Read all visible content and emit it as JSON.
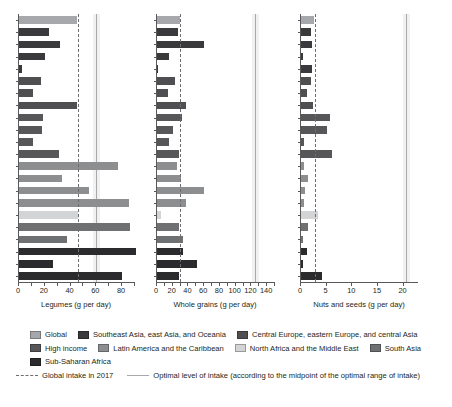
{
  "chart_data": {
    "type": "bar",
    "orientation": "horizontal",
    "title": "",
    "grid": false,
    "legend_position": "bottom",
    "series_names": [
      "Global",
      "Southeast Asia, east Asia, and Oceania",
      "Central Europe, eastern Europe, and central Asia",
      "High income",
      "Latin America and the Caribbean",
      "North Africa and the Middle East",
      "South Asia",
      "Sub-Saharan Africa"
    ],
    "series_colors": [
      "#a6a8ab",
      "#3a3a3c",
      "#4f4f52",
      "#575759",
      "#8c8e90",
      "#d3d4d5",
      "#6e7072",
      "#2b2b2d"
    ],
    "reference_lines": [
      {
        "name": "Global intake in 2017",
        "style": "dashed",
        "color": "#6d6e71"
      },
      {
        "name": "Optimal level of intake (according to the midpoint of the optimal range of intake)",
        "style": "solid",
        "color": "#a7a9ac"
      }
    ],
    "panels": [
      {
        "id": "legumes",
        "xlabel": "Legumes (g per day)",
        "xlim": [
          0,
          90
        ],
        "xticks": [
          0,
          10,
          20,
          30,
          40,
          50,
          60,
          70,
          80,
          90
        ],
        "xticklabels": [
          "0",
          "",
          "20",
          "",
          "40",
          "",
          "60",
          "",
          "80",
          ""
        ],
        "global_intake": 46,
        "optimal_level": 60,
        "bars": [
          {
            "group": "Global",
            "value": 45,
            "color": "#a6a8ab"
          },
          {
            "group": "Southeast Asia, east Asia, and Oceania",
            "value": 23,
            "color": "#3a3a3c"
          },
          {
            "group": "Southeast Asia, east Asia, and Oceania",
            "value": 32,
            "color": "#3a3a3c"
          },
          {
            "group": "Southeast Asia, east Asia, and Oceania",
            "value": 20,
            "color": "#3a3a3c"
          },
          {
            "group": "Southeast Asia, east Asia, and Oceania",
            "value": 2,
            "color": "#3a3a3c"
          },
          {
            "group": "Central Europe, eastern Europe, and central Asia",
            "value": 17,
            "color": "#4f4f52"
          },
          {
            "group": "Central Europe, eastern Europe, and central Asia",
            "value": 11,
            "color": "#4f4f52"
          },
          {
            "group": "Central Europe, eastern Europe, and central Asia",
            "value": 45,
            "color": "#4f4f52"
          },
          {
            "group": "High income",
            "value": 19,
            "color": "#575759"
          },
          {
            "group": "High income",
            "value": 18,
            "color": "#575759"
          },
          {
            "group": "High income",
            "value": 11,
            "color": "#575759"
          },
          {
            "group": "High income",
            "value": 31,
            "color": "#575759"
          },
          {
            "group": "Latin America and the Caribbean",
            "value": 77,
            "color": "#8c8e90"
          },
          {
            "group": "Latin America and the Caribbean",
            "value": 33,
            "color": "#8c8e90"
          },
          {
            "group": "Latin America and the Caribbean",
            "value": 54,
            "color": "#8c8e90"
          },
          {
            "group": "Latin America and the Caribbean",
            "value": 85,
            "color": "#8c8e90"
          },
          {
            "group": "North Africa and the Middle East",
            "value": 46,
            "color": "#d3d4d5"
          },
          {
            "group": "South Asia",
            "value": 86,
            "color": "#6e7072"
          },
          {
            "group": "South Asia",
            "value": 37,
            "color": "#6e7072"
          },
          {
            "group": "Sub-Saharan Africa",
            "value": 91,
            "color": "#2b2b2d"
          },
          {
            "group": "Sub-Saharan Africa",
            "value": 26,
            "color": "#2b2b2d"
          },
          {
            "group": "Sub-Saharan Africa",
            "value": 80,
            "color": "#2b2b2d"
          }
        ]
      },
      {
        "id": "whole-grains",
        "xlabel": "Whole grains (g per day)",
        "xlim": [
          0,
          150
        ],
        "xticks": [
          0,
          10,
          20,
          30,
          40,
          50,
          60,
          70,
          80,
          90,
          100,
          110,
          120,
          130,
          140,
          150
        ],
        "xticklabels": [
          "0",
          "",
          "20",
          "",
          "40",
          "",
          "60",
          "",
          "80",
          "",
          "100",
          "",
          "120",
          "",
          "140",
          ""
        ],
        "global_intake": 29,
        "optimal_level": 125,
        "bars": [
          {
            "group": "Global",
            "value": 29,
            "color": "#a6a8ab"
          },
          {
            "group": "Southeast Asia, east Asia, and Oceania",
            "value": 27,
            "color": "#3a3a3c"
          },
          {
            "group": "Southeast Asia, east Asia, and Oceania",
            "value": 60,
            "color": "#3a3a3c"
          },
          {
            "group": "Southeast Asia, east Asia, and Oceania",
            "value": 15,
            "color": "#3a3a3c"
          },
          {
            "group": "Southeast Asia, east Asia, and Oceania",
            "value": 1,
            "color": "#3a3a3c"
          },
          {
            "group": "Central Europe, eastern Europe, and central Asia",
            "value": 23,
            "color": "#4f4f52"
          },
          {
            "group": "Central Europe, eastern Europe, and central Asia",
            "value": 14,
            "color": "#4f4f52"
          },
          {
            "group": "Central Europe, eastern Europe, and central Asia",
            "value": 37,
            "color": "#4f4f52"
          },
          {
            "group": "High income",
            "value": 32,
            "color": "#575759"
          },
          {
            "group": "High income",
            "value": 20,
            "color": "#575759"
          },
          {
            "group": "High income",
            "value": 15,
            "color": "#575759"
          },
          {
            "group": "High income",
            "value": 28,
            "color": "#575759"
          },
          {
            "group": "Latin America and the Caribbean",
            "value": 25,
            "color": "#8c8e90"
          },
          {
            "group": "Latin America and the Caribbean",
            "value": 30,
            "color": "#8c8e90"
          },
          {
            "group": "Latin America and the Caribbean",
            "value": 60,
            "color": "#8c8e90"
          },
          {
            "group": "Latin America and the Caribbean",
            "value": 37,
            "color": "#8c8e90"
          },
          {
            "group": "North Africa and the Middle East",
            "value": 5,
            "color": "#d3d4d5"
          },
          {
            "group": "South Asia",
            "value": 28,
            "color": "#6e7072"
          },
          {
            "group": "South Asia",
            "value": 33,
            "color": "#6e7072"
          },
          {
            "group": "Sub-Saharan Africa",
            "value": 33,
            "color": "#2b2b2d"
          },
          {
            "group": "Sub-Saharan Africa",
            "value": 51,
            "color": "#2b2b2d"
          },
          {
            "group": "Sub-Saharan Africa",
            "value": 28,
            "color": "#2b2b2d"
          }
        ]
      },
      {
        "id": "nuts-and-seeds",
        "xlabel": "Nuts and seeds (g per day)",
        "xlim": [
          0,
          23
        ],
        "xticks": [
          0,
          5,
          10,
          15,
          20
        ],
        "xticklabels": [
          "0",
          "5",
          "10",
          "15",
          "20"
        ],
        "global_intake": 2.8,
        "optimal_level": 20.5,
        "bars": [
          {
            "group": "Global",
            "value": 2.5,
            "color": "#a6a8ab"
          },
          {
            "group": "Southeast Asia, east Asia, and Oceania",
            "value": 2.0,
            "color": "#3a3a3c"
          },
          {
            "group": "Southeast Asia, east Asia, and Oceania",
            "value": 2.1,
            "color": "#3a3a3c"
          },
          {
            "group": "Southeast Asia, east Asia, and Oceania",
            "value": 0.3,
            "color": "#3a3a3c"
          },
          {
            "group": "Southeast Asia, east Asia, and Oceania",
            "value": 2.1,
            "color": "#3a3a3c"
          },
          {
            "group": "Central Europe, eastern Europe, and central Asia",
            "value": 2.0,
            "color": "#4f4f52"
          },
          {
            "group": "Central Europe, eastern Europe, and central Asia",
            "value": 1.1,
            "color": "#4f4f52"
          },
          {
            "group": "Central Europe, eastern Europe, and central Asia",
            "value": 2.4,
            "color": "#4f4f52"
          },
          {
            "group": "High income",
            "value": 5.6,
            "color": "#575759"
          },
          {
            "group": "High income",
            "value": 5.0,
            "color": "#575759"
          },
          {
            "group": "High income",
            "value": 0.5,
            "color": "#575759"
          },
          {
            "group": "High income",
            "value": 6.0,
            "color": "#575759"
          },
          {
            "group": "Latin America and the Caribbean",
            "value": 0.6,
            "color": "#8c8e90"
          },
          {
            "group": "Latin America and the Caribbean",
            "value": 1.4,
            "color": "#8c8e90"
          },
          {
            "group": "Latin America and the Caribbean",
            "value": 0.8,
            "color": "#8c8e90"
          },
          {
            "group": "Latin America and the Caribbean",
            "value": 0.5,
            "color": "#8c8e90"
          },
          {
            "group": "North Africa and the Middle East",
            "value": 3.3,
            "color": "#d3d4d5"
          },
          {
            "group": "South Asia",
            "value": 1.4,
            "color": "#6e7072"
          },
          {
            "group": "South Asia",
            "value": 0.4,
            "color": "#6e7072"
          },
          {
            "group": "Sub-Saharan Africa",
            "value": 1.2,
            "color": "#2b2b2d"
          },
          {
            "group": "Sub-Saharan Africa",
            "value": 0.4,
            "color": "#2b2b2d"
          },
          {
            "group": "Sub-Saharan Africa",
            "value": 4.1,
            "color": "#2b2b2d"
          }
        ]
      }
    ]
  },
  "legend": {
    "rows": [
      [
        {
          "label": "Global",
          "color": "#a6a8ab"
        },
        {
          "label": "Southeast Asia, east Asia, and Oceania",
          "color": "#3a3a3c"
        },
        {
          "label": "Central Europe, eastern Europe, and central Asia",
          "color": "#4f4f52"
        }
      ],
      [
        {
          "label": "High income",
          "color": "#575759"
        },
        {
          "label": "Latin America and the Caribbean",
          "color": "#8c8e90"
        },
        {
          "label": "North Africa and the Middle East",
          "color": "#d3d4d5"
        },
        {
          "label": "South Asia",
          "color": "#6e7072"
        }
      ],
      [
        {
          "label": "Sub-Saharan Africa",
          "color": "#2b2b2d"
        }
      ]
    ],
    "line_entries": [
      {
        "label": "Global intake in 2017",
        "style": "dashed"
      },
      {
        "label": "Optimal level of intake (according to the midpoint of the optimal range of intake)",
        "style": "solid"
      }
    ]
  }
}
